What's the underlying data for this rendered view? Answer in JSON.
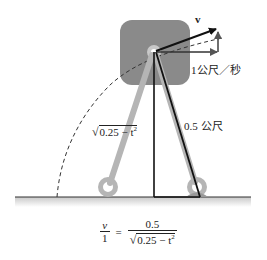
{
  "diagram": {
    "labels": {
      "velocity": "v",
      "horizontal_speed": "1公尺／秒",
      "ladder_length": "0.5 公尺",
      "vertical_height_expr": "0.25 − t",
      "vertical_height_exp": "2"
    },
    "formula": {
      "lhs_num": "v",
      "lhs_den": "1",
      "equals": "=",
      "rhs_num": "0.5",
      "rhs_den_expr": "0.25 − t",
      "rhs_den_exp": "2"
    },
    "colors": {
      "box": "#8a8a8a",
      "rod": "#b5b5b5",
      "line": "#111111",
      "ground_shadow": "#d0d0d0"
    }
  }
}
